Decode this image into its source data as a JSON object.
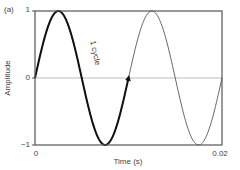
{
  "chart_data": {
    "type": "line",
    "panel_label": "(a)",
    "title": "",
    "xlabel": "Time (s)",
    "ylabel": "Amplitude",
    "xlim": [
      0,
      0.02
    ],
    "ylim": [
      -1,
      1
    ],
    "x_ticks": [
      "0",
      "0.02"
    ],
    "y_ticks": [
      "1",
      "0",
      "-1"
    ],
    "grid": false,
    "zero_line": true,
    "series": [
      {
        "name": "sine wave",
        "function": "sin(2*pi*100*t)",
        "frequency_hz": 100,
        "period_s": 0.01,
        "x": [
          0,
          0.0025,
          0.005,
          0.0075,
          0.01,
          0.0125,
          0.015,
          0.0175,
          0.02
        ],
        "values": [
          0,
          1,
          0,
          -1,
          0,
          1,
          0,
          -1,
          0
        ]
      }
    ],
    "highlight": {
      "range": [
        0,
        0.01
      ],
      "style": "thick black line with arrowhead",
      "label": "1 cycle"
    },
    "colors": {
      "axis": "#555555",
      "zero_line": "#bbbbbb",
      "highlight": "#111111",
      "curve": "#666666"
    }
  },
  "labels": {
    "panel": "(a)",
    "y_top": "1",
    "y_mid": "0",
    "y_bot": "−1",
    "x_left": "0",
    "x_right": "0.02",
    "xlabel": "Time (s)",
    "ylabel": "Amplitude",
    "annotation": "1 cycle"
  }
}
